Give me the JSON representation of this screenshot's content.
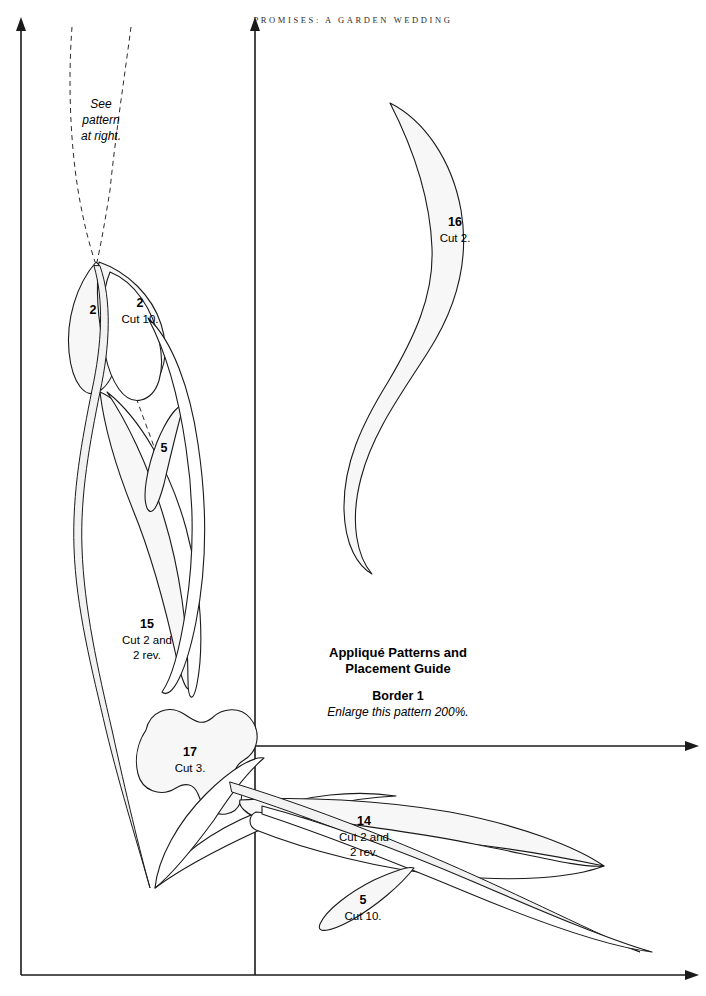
{
  "page": {
    "running_head": "PROMISES: A GARDEN WEDDING",
    "background_color": "#ffffff",
    "ink_color": "#1a1a1a",
    "shape_fill": "#f7f7f7"
  },
  "notes": {
    "see_pattern": "See\npattern\nat right.",
    "see_pattern_line1": "See",
    "see_pattern_line2": "pattern",
    "see_pattern_line3": "at right."
  },
  "caption": {
    "title_line1": "Appliqué Patterns and",
    "title_line2": "Placement Guide",
    "subtitle": "Border 1",
    "note": "Enlarge this pattern 200%."
  },
  "pieces": [
    {
      "id": "piece-2-left",
      "number": "2",
      "cut": "",
      "label_x": 93,
      "label_y": 310
    },
    {
      "id": "piece-2-right",
      "number": "2",
      "cut": "Cut 10.",
      "label_x": 140,
      "label_y": 303
    },
    {
      "id": "piece-5-upper",
      "number": "5",
      "cut": "",
      "label_x": 164,
      "label_y": 448
    },
    {
      "id": "piece-15",
      "number": "15",
      "cut_line1": "Cut 2 and",
      "cut_line2": "2 rev.",
      "label_x": 147,
      "label_y": 624
    },
    {
      "id": "piece-17",
      "number": "17",
      "cut": "Cut 3.",
      "label_x": 190,
      "label_y": 752
    },
    {
      "id": "piece-14",
      "number": "14",
      "cut_line1": "Cut 2 and",
      "cut_line2": "2 rev.",
      "label_x": 364,
      "label_y": 821
    },
    {
      "id": "piece-5-lower",
      "number": "5",
      "cut": "Cut 10.",
      "label_x": 363,
      "label_y": 900
    },
    {
      "id": "piece-16",
      "number": "16",
      "cut": "Cut 2.",
      "label_x": 455,
      "label_y": 222
    }
  ],
  "guides": {
    "vertical_left_label": "left placement line",
    "vertical_center_label": "center placement line",
    "horizontal_label": "bottom placement line"
  }
}
